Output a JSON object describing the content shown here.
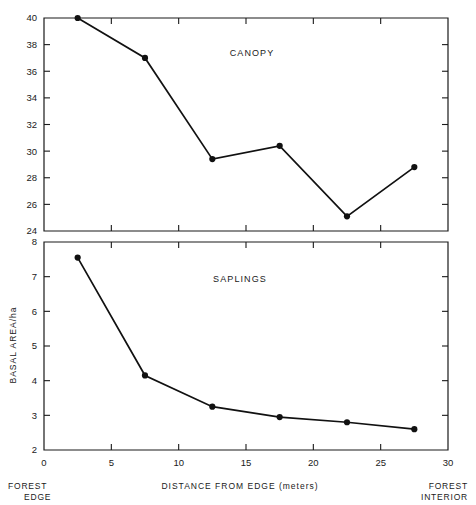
{
  "figure": {
    "ylabel": "BASAL AREA/ha",
    "xlabel": "DISTANCE FROM EDGE (meters)",
    "left_note_line1": "FOREST",
    "left_note_line2": "EDGE",
    "right_note_line1": "FOREST",
    "right_note_line2": "INTERIOR",
    "line_color": "#111111",
    "marker_color": "#111111",
    "axis_color": "#1a1a1a",
    "background": "#ffffff"
  },
  "chart_data": [
    {
      "type": "line",
      "title": "CANOPY",
      "xlabel": "DISTANCE FROM EDGE (meters)",
      "ylabel": "BASAL AREA/ha",
      "x": [
        2.5,
        7.5,
        12.5,
        17.5,
        22.5,
        27.5
      ],
      "values": [
        40.0,
        37.0,
        29.4,
        30.4,
        25.1,
        28.8
      ],
      "xlim": [
        0,
        30
      ],
      "ylim": [
        24,
        40
      ],
      "xticks": [
        0,
        5,
        10,
        15,
        20,
        25,
        30
      ],
      "xticklabels": [
        "0",
        "5",
        "10",
        "15",
        "20",
        "25",
        "30"
      ],
      "yticks": [
        24,
        26,
        28,
        30,
        32,
        34,
        36,
        38,
        40
      ],
      "yticklabels": [
        "24",
        "26",
        "28",
        "30",
        "32",
        "34",
        "36",
        "38",
        "40"
      ],
      "grid": false,
      "legend": "none",
      "marker": "filled-circle"
    },
    {
      "type": "line",
      "title": "SAPLINGS",
      "xlabel": "DISTANCE FROM EDGE (meters)",
      "ylabel": "BASAL AREA/ha",
      "x": [
        2.5,
        7.5,
        12.5,
        17.5,
        22.5,
        27.5
      ],
      "values": [
        7.55,
        4.15,
        3.25,
        2.95,
        2.8,
        2.6
      ],
      "xlim": [
        0,
        30
      ],
      "ylim": [
        2,
        8
      ],
      "xticks": [
        0,
        5,
        10,
        15,
        20,
        25,
        30
      ],
      "xticklabels": [
        "0",
        "5",
        "10",
        "15",
        "20",
        "25",
        "30"
      ],
      "yticks": [
        2,
        3,
        4,
        5,
        6,
        7,
        8
      ],
      "yticklabels": [
        "2",
        "3",
        "4",
        "5",
        "6",
        "7",
        "8"
      ],
      "grid": false,
      "legend": "none",
      "marker": "filled-circle"
    }
  ]
}
